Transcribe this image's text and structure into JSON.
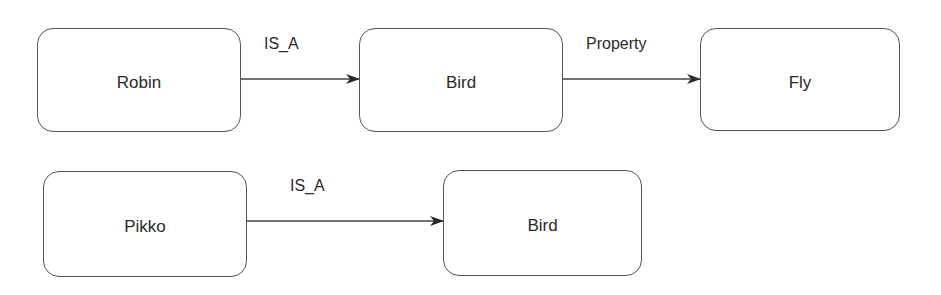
{
  "diagram": {
    "nodes": [
      {
        "id": "robin",
        "label": "Robin"
      },
      {
        "id": "bird1",
        "label": "Bird"
      },
      {
        "id": "fly",
        "label": "Fly"
      },
      {
        "id": "pikko",
        "label": "Pikko"
      },
      {
        "id": "bird2",
        "label": "Bird"
      }
    ],
    "edges": [
      {
        "from": "robin",
        "to": "bird1",
        "label": "IS_A"
      },
      {
        "from": "bird1",
        "to": "fly",
        "label": "Property"
      },
      {
        "from": "pikko",
        "to": "bird2",
        "label": "IS_A"
      }
    ]
  }
}
